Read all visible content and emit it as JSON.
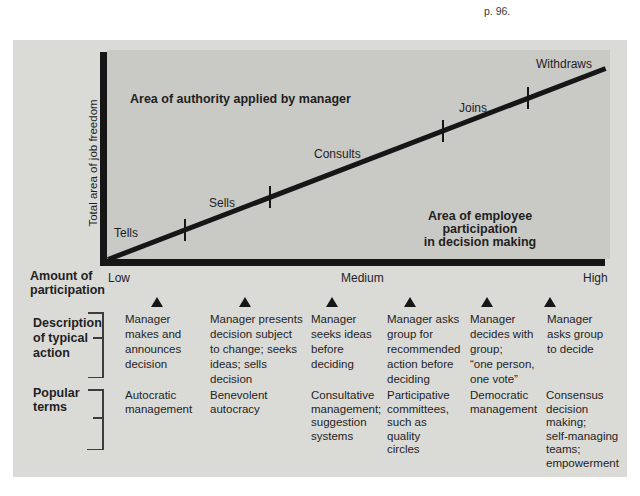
{
  "citation": "p. 96.",
  "colors": {
    "panel_bg": "#dadad7",
    "chart_bg": "#c9c9c6",
    "ink": "#161616"
  },
  "chart": {
    "y_axis_label": "Total area of job freedom",
    "area_labels": {
      "authority": "Area of authority applied by manager",
      "participation": "Area of employee participation\nin decision making"
    },
    "line_labels": [
      "Tells",
      "Sells",
      "Consults",
      "Joins",
      "Withdraws"
    ],
    "x_axis": {
      "low": "Low",
      "medium": "Medium",
      "high": "High"
    }
  },
  "participation_scale": {
    "label": "Amount of\nparticipation"
  },
  "description": {
    "label": "Description\nof typical\naction",
    "columns": [
      "Manager\nmakes and\nannounces\ndecision",
      "Manager presents\ndecision subject\nto change; seeks\nideas; sells\ndecision",
      "Manager\nseeks ideas\nbefore\ndeciding",
      "Manager asks\ngroup for\nrecommended\naction before\ndeciding",
      "Manager\ndecides with\ngroup;\n“one person,\none vote”",
      "Manager\nasks group\nto decide"
    ]
  },
  "popular_terms": {
    "label": "Popular\nterms",
    "columns": [
      "Autocratic\nmanagement",
      "Benevolent\nautocracy",
      "Consultative\nmanagement;\nsuggestion\nsystems",
      "Participative\ncommittees,\nsuch as\nquality\ncircles",
      "Democratic\nmanagement",
      "Consensus\ndecision\nmaking;\nself-managing\nteams;\nempowerment"
    ]
  }
}
